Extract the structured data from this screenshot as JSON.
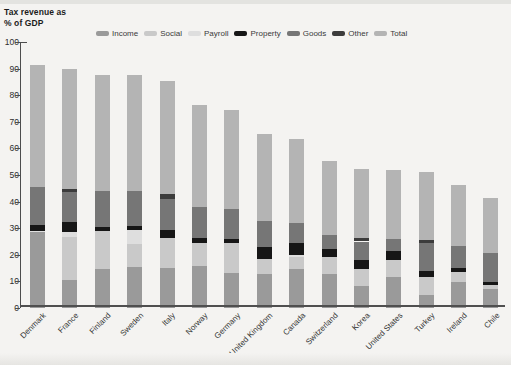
{
  "title": {
    "line1": "Tax revenue as",
    "line2": "% of GDP"
  },
  "axis": {
    "y_min": 0,
    "y_max": 100,
    "y_ticks": [
      0,
      10,
      20,
      30,
      40,
      50,
      60,
      70,
      80,
      90,
      100
    ]
  },
  "legend": [
    "Income",
    "Social",
    "Payroll",
    "Property",
    "Goods",
    "Other",
    "Total"
  ],
  "colors": {
    "Income": "#9a9a9a",
    "Social": "#c9c9c9",
    "Payroll": "#dedede",
    "Property": "#161616",
    "Goods": "#767676",
    "Other": "#3c3c3c",
    "Total": "#b4b4b4",
    "axis": "#4d4d4d",
    "text": "#2e2e2e"
  },
  "chart_data": {
    "type": "bar",
    "stacked": true,
    "title": "Tax revenue as % of GDP",
    "xlabel": "",
    "ylabel": "% of GDP",
    "ylim": [
      0,
      100
    ],
    "grid": false,
    "legend_position": "top",
    "categories": [
      "Denmark",
      "France",
      "Finland",
      "Sweden",
      "Italy",
      "Norway",
      "Germany",
      "United Kingdom",
      "Canada",
      "Switzerland",
      "Korea",
      "United States",
      "Turkey",
      "Ireland",
      "Chile"
    ],
    "series": [
      {
        "name": "Income",
        "values": [
          28.7,
          10.5,
          14.5,
          15.3,
          15.0,
          15.9,
          13.2,
          12.6,
          14.5,
          12.7,
          8.3,
          11.5,
          4.8,
          9.8,
          7.1
        ]
      },
      {
        "name": "Social",
        "values": [
          0.1,
          16.2,
          14.3,
          8.9,
          11.3,
          8.4,
          11.2,
          5.7,
          4.8,
          6.3,
          6.3,
          6.6,
          6.8,
          3.6,
          1.4
        ]
      },
      {
        "name": "Payroll",
        "values": [
          0.3,
          1.8,
          0.0,
          5.0,
          0.0,
          0.0,
          0.0,
          0.0,
          0.7,
          0.0,
          0.0,
          0.0,
          0.0,
          0.0,
          0.0
        ]
      },
      {
        "name": "Property",
        "values": [
          2.0,
          3.9,
          1.5,
          1.6,
          3.2,
          1.9,
          1.7,
          4.6,
          4.3,
          3.0,
          3.5,
          3.4,
          2.2,
          1.8,
          1.2
        ]
      },
      {
        "name": "Goods",
        "values": [
          14.5,
          11.1,
          13.5,
          13.0,
          11.5,
          11.9,
          11.2,
          9.9,
          7.5,
          5.6,
          6.9,
          4.5,
          10.8,
          8.0,
          10.9
        ]
      },
      {
        "name": "Other",
        "values": [
          0.0,
          1.4,
          0.0,
          0.0,
          1.7,
          0.0,
          0.0,
          0.0,
          0.0,
          0.0,
          1.2,
          0.0,
          0.9,
          0.0,
          0.0
        ]
      },
      {
        "name": "Total",
        "values": [
          45.6,
          44.9,
          43.8,
          43.8,
          42.7,
          38.1,
          37.3,
          32.8,
          31.8,
          27.6,
          26.2,
          26.0,
          25.5,
          23.2,
          20.6
        ]
      }
    ]
  }
}
